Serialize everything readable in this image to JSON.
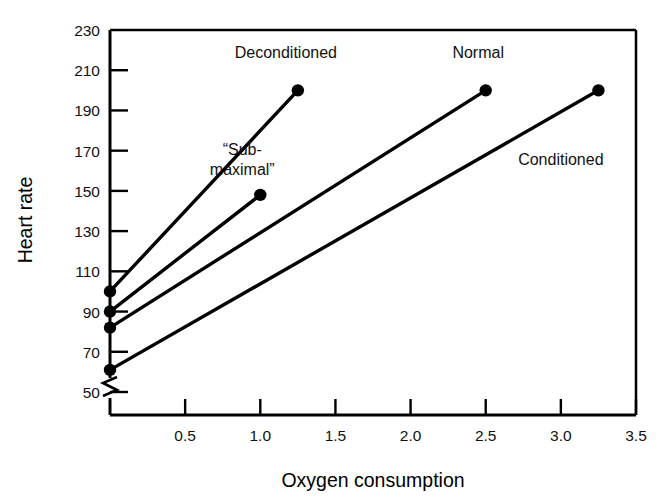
{
  "chart_data": {
    "type": "line",
    "title": "",
    "xlabel": "Oxygen consumption",
    "ylabel": "Heart rate",
    "xlim": [
      0,
      3.5
    ],
    "ylim": [
      50,
      230
    ],
    "y_axis_break": true,
    "grid": false,
    "legend_position": "inline-annotations",
    "xticks": [
      0.5,
      1.0,
      1.5,
      2.0,
      2.5,
      3.0,
      3.5
    ],
    "xtick_labels": [
      "0.5",
      "1.0",
      "1.5",
      "2.0",
      "2.5",
      "3.0",
      "3.5"
    ],
    "yticks": [
      50,
      70,
      90,
      110,
      130,
      150,
      170,
      190,
      210,
      230
    ],
    "ytick_labels": [
      "50",
      "70",
      "90",
      "110",
      "130",
      "150",
      "170",
      "190",
      "210",
      "230"
    ],
    "series": [
      {
        "name": "Deconditioned",
        "x": [
          0.0,
          1.25
        ],
        "y": [
          100,
          200
        ],
        "marker_points": [
          [
            0.0,
            100
          ],
          [
            1.25,
            200
          ]
        ],
        "color": "#000000"
      },
      {
        "name": "“Sub-maximal”",
        "x": [
          0.0,
          1.0
        ],
        "y": [
          90,
          148
        ],
        "marker_points": [
          [
            0.0,
            90
          ],
          [
            1.0,
            148
          ]
        ],
        "color": "#000000"
      },
      {
        "name": "Normal",
        "x": [
          0.0,
          2.5
        ],
        "y": [
          82,
          200
        ],
        "marker_points": [
          [
            0.0,
            82
          ],
          [
            2.5,
            200
          ]
        ],
        "color": "#000000"
      },
      {
        "name": "Conditioned",
        "x": [
          0.0,
          3.25
        ],
        "y": [
          61,
          200
        ],
        "marker_points": [
          [
            0.0,
            61
          ],
          [
            3.25,
            200
          ]
        ],
        "color": "#000000"
      }
    ],
    "annotations": [
      {
        "text": "Deconditioned",
        "x": 1.17,
        "y": 216
      },
      {
        "text": "“Sub-",
        "x": 0.88,
        "y": 168
      },
      {
        "text": "maximal”",
        "x": 0.88,
        "y": 158
      },
      {
        "text": "Normal",
        "x": 2.45,
        "y": 216
      },
      {
        "text": "Conditioned",
        "x": 3.0,
        "y": 163
      }
    ]
  },
  "axes": {
    "y_title": "Heart rate",
    "x_title": "Oxygen consumption"
  },
  "colors": {
    "line": "#000000",
    "marker": "#000000",
    "axis": "#000000",
    "background": "#ffffff",
    "text": "#111111"
  }
}
